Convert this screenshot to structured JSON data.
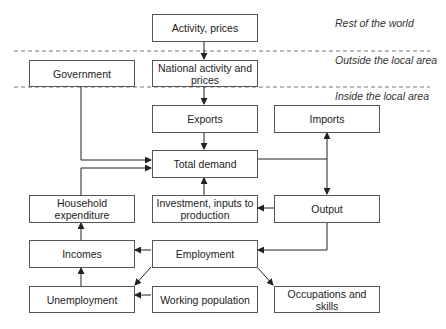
{
  "zones": [
    {
      "label": "Rest of the world"
    },
    {
      "label": "Outside the local area"
    },
    {
      "label": "Inside the local area"
    }
  ],
  "nodes": {
    "activity_prices": "Activity, prices",
    "national_activity": "National activity and prices",
    "government": "Government",
    "exports": "Exports",
    "imports": "Imports",
    "total_demand": "Total demand",
    "household_expenditure": "Household expenditure",
    "investment": "Investment, inputs to production",
    "output": "Output",
    "incomes": "Incomes",
    "employment": "Employment",
    "unemployment": "Unemployment",
    "working_population": "Working population",
    "occupations_skills": "Occupations and skills"
  },
  "edges": [
    {
      "from": "Activity, prices",
      "to": "National activity and prices"
    },
    {
      "from": "National activity and prices",
      "to": "Exports"
    },
    {
      "from": "Exports",
      "to": "Total demand"
    },
    {
      "from": "Government",
      "to": "Total demand"
    },
    {
      "from": "Household expenditure",
      "to": "Total demand"
    },
    {
      "from": "Investment, inputs to production",
      "to": "Total demand"
    },
    {
      "from": "Total demand",
      "to": "Imports"
    },
    {
      "from": "Total demand",
      "to": "Output"
    },
    {
      "from": "Output",
      "to": "Investment, inputs to production"
    },
    {
      "from": "Output",
      "to": "Employment"
    },
    {
      "from": "Employment",
      "to": "Incomes"
    },
    {
      "from": "Employment",
      "to": "Unemployment"
    },
    {
      "from": "Employment",
      "to": "Occupations and skills"
    },
    {
      "from": "Working population",
      "to": "Unemployment"
    },
    {
      "from": "Unemployment",
      "to": "Incomes"
    },
    {
      "from": "Incomes",
      "to": "Household expenditure"
    }
  ]
}
